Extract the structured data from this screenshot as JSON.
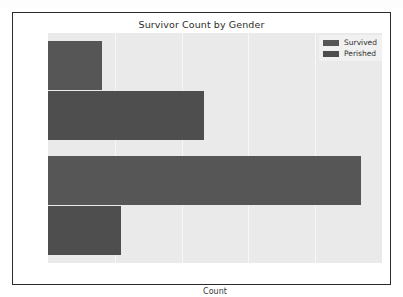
{
  "chart_data": {
    "type": "bar",
    "orientation": "horizontal",
    "title": "Survivor Count by Gender",
    "xlabel": "Count",
    "ylabel": "",
    "categories": [
      "Women",
      "Men"
    ],
    "series": [
      {
        "name": "Survived",
        "values": [
          81,
          468
        ],
        "color": "#565656"
      },
      {
        "name": "Perished",
        "values": [
          233,
          109
        ],
        "color": "#4e4e4e"
      }
    ],
    "xlim": [
      0,
      500
    ],
    "xticks": [
      0,
      100,
      200,
      300,
      400,
      500
    ],
    "xtick_labels": [
      "0",
      "100",
      "200",
      "300",
      "400",
      "500"
    ],
    "grid": true,
    "grid_axis": "x",
    "legend_position": "upper right",
    "plot_background": "#eaeaea",
    "figure_background": "#ffffff",
    "gridline_color": "#f7f7f7"
  },
  "legend": {
    "entries": [
      {
        "label": "Survived",
        "swatch_class": "survived"
      },
      {
        "label": "Perished",
        "swatch_class": "perished"
      }
    ]
  }
}
